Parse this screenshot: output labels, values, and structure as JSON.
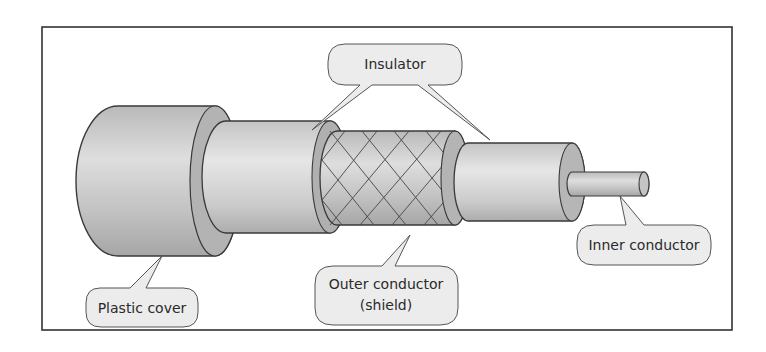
{
  "diagram": {
    "labels": {
      "insulator": "Insulator",
      "plastic_cover": "Plastic cover",
      "outer_conductor_line1": "Outer conductor",
      "outer_conductor_line2": "(shield)",
      "inner_conductor": "Inner conductor"
    },
    "colors": {
      "frame": "#333333",
      "body_fill": "#c8c8c8",
      "body_dark": "#a8a8a8",
      "ring_fill": "#b5b5b5",
      "callout_fill": "#ececec",
      "outline": "#3a3a3a"
    }
  }
}
